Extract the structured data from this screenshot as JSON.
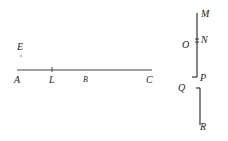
{
  "diagram": {
    "points": {
      "E": "E",
      "A": "A",
      "L": "L",
      "B": "B",
      "C": "C",
      "M": "M",
      "N": "N",
      "O": "O",
      "P": "P",
      "Q": "Q",
      "R": "R"
    },
    "line_color": "#333333"
  }
}
